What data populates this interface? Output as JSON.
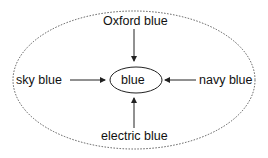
{
  "diagram": {
    "center": {
      "label": "blue"
    },
    "nodes": {
      "top": {
        "label": "Oxford blue"
      },
      "left": {
        "label": "sky blue"
      },
      "right": {
        "label": "navy blue"
      },
      "bottom": {
        "label": "electric blue"
      }
    },
    "edges": [
      {
        "from": "Oxford blue",
        "to": "blue"
      },
      {
        "from": "sky blue",
        "to": "blue"
      },
      {
        "from": "navy blue",
        "to": "blue"
      },
      {
        "from": "electric blue",
        "to": "blue"
      }
    ],
    "colors": {
      "stroke": "#222222",
      "background": "#ffffff"
    }
  }
}
